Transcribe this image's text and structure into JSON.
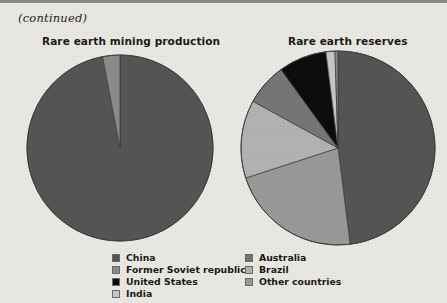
{
  "page": {
    "continued_note": "(continued)",
    "background_color": "#eceae4",
    "rule_color": "#8e8c86"
  },
  "palette": {
    "china": "#565656",
    "former_soviet_republics": "#8c8c8c",
    "united_states": "#0d0d0d",
    "india": "#c8c8c8",
    "australia": "#777777",
    "brazil": "#b4b4b4",
    "other_countries": "#9a9a9a",
    "slice_outline": "#3a3a3a"
  },
  "legend": {
    "column_1": [
      {
        "label": "China",
        "color": "#565656",
        "swatch": "legend-swatch-china"
      },
      {
        "label": "Former Soviet republics",
        "color": "#8c8c8c",
        "swatch": "legend-swatch-former-soviet-republics"
      },
      {
        "label": "United States",
        "color": "#0d0d0d",
        "swatch": "legend-swatch-united-states"
      },
      {
        "label": "India",
        "color": "#c8c8c8",
        "swatch": "legend-swatch-india"
      }
    ],
    "column_2": [
      {
        "label": "Australia",
        "color": "#777777",
        "swatch": "legend-swatch-australia"
      },
      {
        "label": "Brazil",
        "color": "#b4b4b4",
        "swatch": "legend-swatch-brazil"
      },
      {
        "label": "Other countries",
        "color": "#9a9a9a",
        "swatch": "legend-swatch-other-countries"
      }
    ]
  },
  "chart_data": [
    {
      "type": "pie",
      "id": "rare-earth-mining-production",
      "title": "Rare earth mining production",
      "xlabel": "",
      "ylabel": "",
      "start_angle_deg": 0,
      "direction": "clockwise",
      "legend_position": "bottom",
      "categories": [
        "China",
        "Former Soviet republics"
      ],
      "values": [
        97,
        3
      ],
      "unit": "percent",
      "slices": [
        {
          "label": "China",
          "value": 97,
          "color": "#565656"
        },
        {
          "label": "Former Soviet republics",
          "value": 3,
          "color": "#8c8c8c"
        }
      ]
    },
    {
      "type": "pie",
      "id": "rare-earth-reserves",
      "title": "Rare earth reserves",
      "xlabel": "",
      "ylabel": "",
      "start_angle_deg": 0,
      "direction": "clockwise",
      "legend_position": "bottom",
      "categories": [
        "China",
        "Other countries",
        "Brazil",
        "Australia",
        "United States",
        "India",
        "Former Soviet republics"
      ],
      "values": [
        48,
        22,
        13,
        7,
        8,
        1.5,
        0.5
      ],
      "unit": "percent",
      "slices": [
        {
          "label": "China",
          "value": 48,
          "color": "#565656"
        },
        {
          "label": "Other countries",
          "value": 22,
          "color": "#9a9a9a"
        },
        {
          "label": "Brazil",
          "value": 13,
          "color": "#b4b4b4"
        },
        {
          "label": "Australia",
          "value": 7,
          "color": "#777777"
        },
        {
          "label": "United States",
          "value": 8,
          "color": "#0d0d0d"
        },
        {
          "label": "India",
          "value": 1.5,
          "color": "#c8c8c8"
        },
        {
          "label": "Former Soviet republics",
          "value": 0.5,
          "color": "#8c8c8c"
        }
      ]
    }
  ]
}
